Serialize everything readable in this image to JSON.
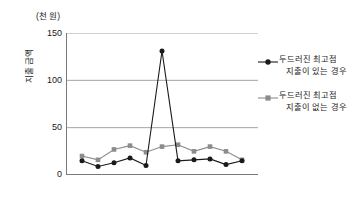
{
  "chart_data": {
    "type": "line",
    "title": "",
    "unit_label": "(천 원)",
    "ylabel": "지출 금액",
    "xlabel": "",
    "ylim": [
      0,
      150
    ],
    "yticks": [
      0,
      50,
      100,
      150
    ],
    "ytick_labels": [
      "0",
      "50",
      "100",
      "150"
    ],
    "grid": true,
    "grid_axis": "y",
    "xtick_count": 13,
    "xtick_labels": [],
    "legend_position": "right",
    "x": [
      1,
      2,
      3,
      4,
      5,
      6,
      7,
      8,
      9,
      10,
      11
    ],
    "series": [
      {
        "name": "두드러진 최고점 지출이 있는 경우",
        "marker": "circle",
        "color": "#1a1a1a",
        "values": [
          15,
          9,
          13,
          18,
          10,
          131,
          15,
          16,
          17,
          11,
          15
        ]
      },
      {
        "name": "두드러진 최고점 지출이 없는 경우",
        "marker": "square",
        "color": "#8c8c8c",
        "values": [
          20,
          16,
          27,
          31,
          24,
          30,
          32,
          25,
          30,
          25,
          16
        ]
      }
    ],
    "colors": {
      "series1": "#1a1a1a",
      "series2": "#8c8c8c",
      "gridline": "#9a9a9a",
      "axis": "#7a7a7a",
      "background": "#ffffff"
    },
    "annotations": []
  },
  "legend": {
    "entries": [
      {
        "line1": "두드러진 최고점",
        "line2": "지출이 있는 경우"
      },
      {
        "line1": "두드러진 최고점",
        "line2": "지출이 없는 경우"
      }
    ]
  }
}
